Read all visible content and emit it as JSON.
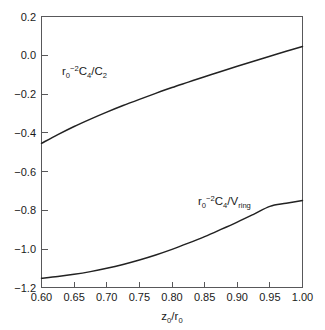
{
  "chart_data": {
    "type": "line",
    "title": "",
    "xlabel": "z0/r0",
    "ylabel": "",
    "xlim": [
      0.6,
      1.0
    ],
    "ylim": [
      -1.2,
      0.2
    ],
    "grid": false,
    "legend_position": "inline-labels",
    "x_ticks": [
      "0.60",
      "0.65",
      "0.70",
      "0.75",
      "0.80",
      "0.85",
      "0.90",
      "0.95",
      "1.00"
    ],
    "x_tick_values": [
      0.6,
      0.65,
      0.7,
      0.75,
      0.8,
      0.85,
      0.9,
      0.95,
      1.0
    ],
    "y_ticks": [
      "0.2",
      "0.0",
      "−0.2",
      "−0.4",
      "−0.6",
      "−0.8",
      "−1.0",
      "−1.2"
    ],
    "y_tick_values": [
      0.2,
      0.0,
      -0.2,
      -0.4,
      -0.6,
      -0.8,
      -1.0,
      -1.2
    ],
    "x": [
      0.6,
      0.625,
      0.65,
      0.675,
      0.7,
      0.725,
      0.75,
      0.775,
      0.8,
      0.825,
      0.85,
      0.875,
      0.9,
      0.925,
      0.95,
      0.975,
      1.0
    ],
    "series": [
      {
        "name": "r0^2 C4 / C2",
        "label_text": "r0-2C4/C2",
        "values": [
          -0.455,
          -0.41,
          -0.368,
          -0.33,
          -0.294,
          -0.26,
          -0.228,
          -0.197,
          -0.167,
          -0.139,
          -0.111,
          -0.084,
          -0.057,
          -0.031,
          -0.005,
          0.02,
          0.045
        ]
      },
      {
        "name": "r0^2 C4 / Vring",
        "label_text": "r0-2C4/Vring",
        "values": [
          -1.152,
          -1.143,
          -1.132,
          -1.118,
          -1.101,
          -1.081,
          -1.058,
          -1.032,
          -1.003,
          -0.971,
          -0.937,
          -0.9,
          -0.862,
          -0.822,
          -0.781,
          -0.765,
          -0.75
        ]
      }
    ],
    "series_labels": [
      {
        "base1": "r",
        "sub1": "0",
        "sup1": "−2",
        "base2": "C",
        "sub2": "4",
        "slash": "/",
        "base3": "C",
        "sub3": "2"
      },
      {
        "base1": "r",
        "sub1": "0",
        "sup1": "−2",
        "base2": "C",
        "sub2": "4",
        "slash": "/",
        "base3": "V",
        "sub3": "ring"
      }
    ],
    "axis_title": {
      "base1": "z",
      "sub1": "0",
      "slash": "/",
      "base2": "r",
      "sub2": "0"
    },
    "colors": {
      "curve": "#222222",
      "frame": "#58585a",
      "text": "#1a1a1a",
      "background": "#ffffff"
    }
  }
}
